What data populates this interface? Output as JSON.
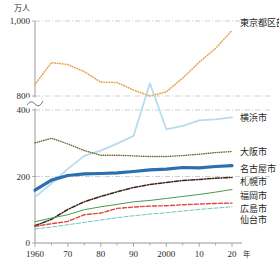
{
  "chart_data": {
    "type": "line",
    "title": "",
    "unit_label": "万人",
    "xlabel_suffix": "年",
    "ylabel": "",
    "grid": true,
    "axis_break": true,
    "axis_break_note": "y-axis broken between 400 and 800",
    "legend_position": "right-inline",
    "x": [
      1960,
      1965,
      1970,
      1975,
      1980,
      1985,
      1990,
      1995,
      2000,
      2005,
      2010,
      2015,
      2020
    ],
    "xticks": [
      {
        "value": 1960,
        "label": "1960"
      },
      {
        "value": 1970,
        "label": "70"
      },
      {
        "value": 1980,
        "label": "80"
      },
      {
        "value": 1990,
        "label": "90"
      },
      {
        "value": 2000,
        "label": "2000"
      },
      {
        "value": 2010,
        "label": "10"
      },
      {
        "value": 2020,
        "label": "20"
      }
    ],
    "yticks": [
      {
        "value": 0,
        "label": "0"
      },
      {
        "value": 200,
        "label": "200"
      },
      {
        "value": 400,
        "label": "400"
      },
      {
        "value": 800,
        "label": "800"
      },
      {
        "value": 1000,
        "label": "1,000"
      }
    ],
    "xlim": [
      1960,
      2020
    ],
    "ylim": [
      0,
      1000
    ],
    "series": [
      {
        "name": "東京都区部",
        "label": "東京都区部",
        "color": "#e0a94e",
        "style": "dotted",
        "width": 1.6,
        "label_y": 26,
        "values": [
          831,
          889,
          884,
          865,
          837,
          836,
          816,
          800,
          811,
          848,
          890,
          927,
          975
        ]
      },
      {
        "name": "横浜市",
        "label": "横浜市",
        "color": "#b8dcef",
        "style": "solid",
        "width": 1.8,
        "label_y": 121,
        "values": [
          138,
          179,
          223,
          262,
          278,
          299,
          322,
          834,
          342,
          352,
          369,
          372,
          378
        ]
      },
      {
        "name": "大阪市",
        "label": "大阪市",
        "color": "#6b6b32",
        "style": "dotted",
        "width": 1.4,
        "label_y": 155,
        "values": [
          301,
          315,
          298,
          278,
          264,
          264,
          262,
          260,
          260,
          263,
          267,
          272,
          275
        ]
      },
      {
        "name": "名古屋市",
        "label": "名古屋市",
        "color": "#2c6fb0",
        "style": "solid",
        "width": 3.2,
        "label_y": 172,
        "values": [
          159,
          189,
          203,
          208,
          209,
          211,
          215,
          220,
          222,
          227,
          226,
          230,
          233
        ]
      },
      {
        "name": "札幌市",
        "label": "札幌市",
        "color": "#3a2418",
        "style": "dashdot",
        "width": 1.5,
        "label_y": 185,
        "values": [
          52,
          71,
          101,
          124,
          140,
          154,
          167,
          176,
          182,
          188,
          191,
          195,
          197
        ]
      },
      {
        "name": "福岡市",
        "label": "福岡市",
        "color": "#4a9a4a",
        "style": "solid",
        "width": 1.0,
        "label_y": 199,
        "values": [
          64,
          75,
          85,
          100,
          109,
          116,
          124,
          128,
          134,
          140,
          146,
          153,
          161
        ]
      },
      {
        "name": "広島市",
        "label": "広島市",
        "color": "#e2453c",
        "style": "dashed",
        "width": 1.4,
        "label_y": 212,
        "values": [
          50,
          58,
          65,
          85,
          90,
          104,
          108,
          111,
          112,
          115,
          117,
          119,
          120
        ]
      },
      {
        "name": "仙台市",
        "label": "仙台市",
        "color": "#6fc5c0",
        "style": "dashed",
        "width": 1.0,
        "label_y": 223,
        "values": [
          42,
          48,
          55,
          62,
          69,
          76,
          82,
          87,
          91,
          96,
          101,
          105,
          109
        ]
      }
    ]
  }
}
